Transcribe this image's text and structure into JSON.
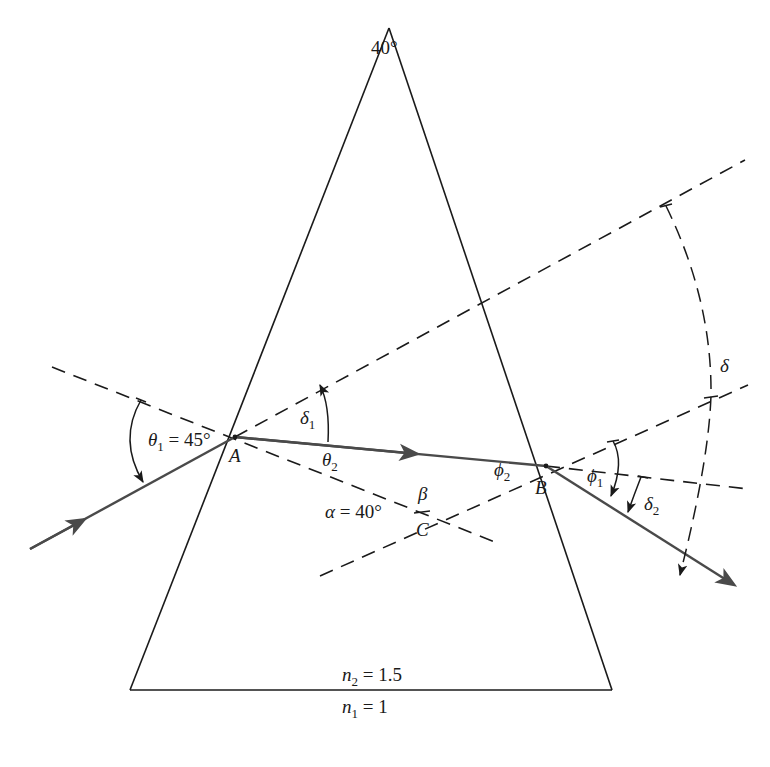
{
  "diagram": {
    "type": "prism-refraction",
    "colors": {
      "outline": "#1a1a1a",
      "ray": "#4a4a4a",
      "dashed": "#1a1a1a",
      "background": "#ffffff"
    },
    "prism": {
      "apex_angle_label": "40°",
      "inside_index_label": {
        "symbol": "n",
        "sub": "2",
        "value": "= 1.5"
      },
      "outside_index_label": {
        "symbol": "n",
        "sub": "1",
        "value": "= 1"
      }
    },
    "points": {
      "A": "A",
      "B": "B",
      "C": "C"
    },
    "angles": {
      "theta1": {
        "symbol": "θ",
        "sub": "1",
        "value": "= 45°"
      },
      "theta2": {
        "symbol": "θ",
        "sub": "2"
      },
      "delta1": {
        "symbol": "δ",
        "sub": "1"
      },
      "phi2": {
        "symbol": "ϕ",
        "sub": "2"
      },
      "phi1": {
        "symbol": "ϕ",
        "sub": "1"
      },
      "delta2": {
        "symbol": "δ",
        "sub": "2"
      },
      "delta": {
        "symbol": "δ"
      },
      "alpha": {
        "symbol": "α",
        "value": "= 40°"
      },
      "beta": {
        "symbol": "β"
      }
    }
  }
}
